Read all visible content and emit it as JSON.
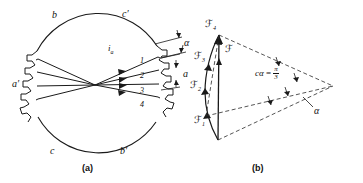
{
  "figure": {
    "panels": [
      {
        "id": "a",
        "caption": "(a)",
        "description": "Stator cross-section with distributed phase belts",
        "phase_labels": [
          {
            "name": "b",
            "text": "b"
          },
          {
            "name": "c-prime",
            "text": "c′"
          },
          {
            "name": "a-prime",
            "text": "a′"
          },
          {
            "name": "c",
            "text": "c"
          },
          {
            "name": "b-prime",
            "text": "b′"
          }
        ],
        "current_label": "i",
        "current_sub": "a",
        "slot_numbers": [
          "1",
          "2",
          "3",
          "4"
        ],
        "angle_label": "α",
        "span_label": "a",
        "slot_count_per_side": 4
      },
      {
        "id": "b",
        "caption": "(b)",
        "description": "Phasor sum of coil MMFs on a circular arc",
        "phasors": [
          {
            "name": "F1",
            "symbol": "ℱ",
            "sub": "1"
          },
          {
            "name": "F2",
            "symbol": "ℱ",
            "sub": "2"
          },
          {
            "name": "F3",
            "symbol": "ℱ",
            "sub": "3"
          },
          {
            "name": "F4",
            "symbol": "ℱ",
            "sub": "4"
          }
        ],
        "resultant": {
          "name": "F",
          "symbol": "ℱ",
          "sub": ""
        },
        "arc_angle": {
          "lhs": "cα",
          "eq": "=",
          "num": "π",
          "den": "3"
        },
        "angle_label": "α"
      }
    ]
  },
  "colors": {
    "stroke": "#1a1a1a",
    "background": "#ffffff",
    "dashed": "#2a2a2a"
  }
}
